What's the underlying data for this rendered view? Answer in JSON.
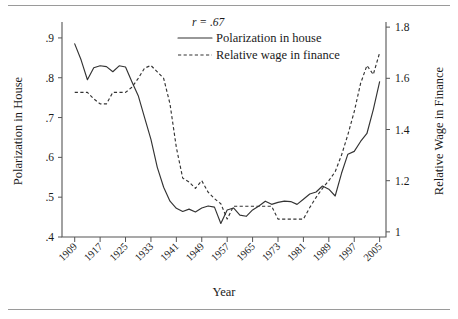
{
  "figure": {
    "rules": {
      "top_label": "top-rule",
      "bottom_label": "bottom-rule"
    }
  },
  "chart_data": {
    "type": "line",
    "title": "",
    "subtitle": "",
    "xlabel": "Year",
    "ylabel": "Polarization in House",
    "y2label": "Relative Wage in Finance",
    "grid": false,
    "legend_position": "top-center",
    "annotations": [
      {
        "name": "correlation",
        "text": "r = .67",
        "x": 1945,
        "y_axis": "left",
        "y": 0.955
      }
    ],
    "xlim": [
      1905,
      2007
    ],
    "xticks": [
      1909,
      1917,
      1925,
      1933,
      1941,
      1949,
      1957,
      1965,
      1973,
      1981,
      1989,
      1997,
      2005
    ],
    "xticklabels": [
      "1909",
      "1917",
      "1925",
      "1933",
      "1941",
      "1949",
      "1957",
      "1965",
      "1973",
      "1981",
      "1989",
      "1997",
      "2005"
    ],
    "ylim": [
      0.4,
      0.94
    ],
    "yticks": [
      0.4,
      0.5,
      0.6,
      0.7,
      0.8,
      0.9
    ],
    "yticklabels": [
      ".4",
      ".5",
      ".6",
      ".7",
      ".8",
      ".9"
    ],
    "y2lim": [
      0.98,
      1.82
    ],
    "y2ticks": [
      1.0,
      1.2,
      1.4,
      1.6,
      1.8
    ],
    "y2ticklabels": [
      "1",
      "1.2",
      "1.4",
      "1.6",
      "1.8"
    ],
    "series": [
      {
        "name": "Polarization in house",
        "legend_label": "Polarization in house",
        "style": "solid",
        "axis": "left",
        "x": [
          1909,
          1911,
          1913,
          1915,
          1917,
          1919,
          1921,
          1923,
          1925,
          1927,
          1929,
          1931,
          1933,
          1935,
          1937,
          1939,
          1941,
          1943,
          1945,
          1947,
          1949,
          1951,
          1953,
          1955,
          1957,
          1959,
          1961,
          1963,
          1965,
          1967,
          1969,
          1971,
          1973,
          1975,
          1977,
          1979,
          1981,
          1983,
          1985,
          1987,
          1989,
          1991,
          1993,
          1995,
          1997,
          1999,
          2001,
          2003,
          2005
        ],
        "values": [
          0.885,
          0.845,
          0.795,
          0.825,
          0.83,
          0.828,
          0.815,
          0.83,
          0.827,
          0.79,
          0.755,
          0.7,
          0.645,
          0.575,
          0.525,
          0.49,
          0.472,
          0.464,
          0.47,
          0.463,
          0.473,
          0.478,
          0.475,
          0.434,
          0.468,
          0.473,
          0.455,
          0.452,
          0.468,
          0.478,
          0.49,
          0.482,
          0.487,
          0.49,
          0.489,
          0.482,
          0.495,
          0.508,
          0.513,
          0.528,
          0.52,
          0.503,
          0.56,
          0.608,
          0.615,
          0.64,
          0.66,
          0.72,
          0.79
        ]
      },
      {
        "name": "Relative wage in finance",
        "legend_label": "Relative wage in finance",
        "style": "dashed",
        "axis": "right",
        "x": [
          1909,
          1911,
          1913,
          1915,
          1917,
          1919,
          1921,
          1923,
          1925,
          1927,
          1929,
          1931,
          1933,
          1935,
          1937,
          1939,
          1941,
          1943,
          1945,
          1947,
          1949,
          1951,
          1953,
          1955,
          1957,
          1959,
          1961,
          1963,
          1965,
          1967,
          1969,
          1971,
          1973,
          1975,
          1977,
          1979,
          1981,
          1983,
          1985,
          1987,
          1989,
          1991,
          1993,
          1995,
          1997,
          1999,
          2001,
          2003,
          2005
        ],
        "values": [
          1.545,
          1.545,
          1.545,
          1.52,
          1.5,
          1.5,
          1.545,
          1.545,
          1.545,
          1.565,
          1.6,
          1.64,
          1.65,
          1.625,
          1.6,
          1.5,
          1.33,
          1.21,
          1.195,
          1.17,
          1.2,
          1.155,
          1.13,
          1.11,
          1.05,
          1.1,
          1.1,
          1.1,
          1.1,
          1.1,
          1.1,
          1.1,
          1.05,
          1.05,
          1.05,
          1.05,
          1.05,
          1.095,
          1.135,
          1.17,
          1.2,
          1.235,
          1.3,
          1.38,
          1.47,
          1.58,
          1.65,
          1.615,
          1.7
        ]
      }
    ]
  },
  "legend": {
    "entries": [
      {
        "label": "Polarization in house",
        "style": "solid"
      },
      {
        "label": "Relative wage in finance",
        "style": "dashed"
      }
    ]
  }
}
